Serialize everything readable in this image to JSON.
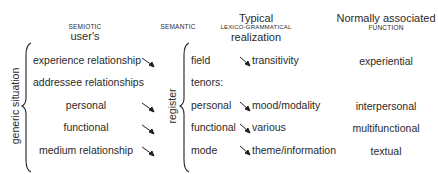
{
  "headers": {
    "semiotic_small": "SEMIOTIC",
    "semiotic_main": "user's",
    "semantic_small": "SEMANTIC",
    "typical": "Typical",
    "lexico_small": "LEXICO-GRAMMATICAL",
    "realization": "realization",
    "normally": "Normally associated",
    "function_small": "FUNCTION"
  },
  "left_group": {
    "label": "generic situation",
    "items": [
      {
        "label": "experience relationship",
        "arrow": true
      },
      {
        "label": "addressee relationships",
        "arrow": false
      },
      {
        "label": "personal",
        "arrow": true
      },
      {
        "label": "functional",
        "arrow": true
      },
      {
        "label": "medium relationship",
        "arrow": true
      }
    ]
  },
  "register_group": {
    "label": "register",
    "items": [
      {
        "label": "field",
        "realization": "transitivity",
        "function": "experiential"
      },
      {
        "label": "tenors:",
        "realization": "",
        "function": ""
      },
      {
        "label": "personal",
        "realization": "mood/modality",
        "function": "interpersonal"
      },
      {
        "label": "functional",
        "realization": "various",
        "function": "multifunctional"
      },
      {
        "label": "mode",
        "realization": "theme/information",
        "function": "textual"
      }
    ]
  }
}
